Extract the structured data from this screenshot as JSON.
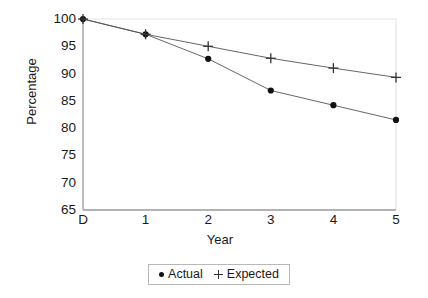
{
  "chart_data": {
    "type": "line",
    "title": "",
    "xlabel": "Year",
    "ylabel": "Percentage",
    "categories": [
      "D",
      "1",
      "2",
      "3",
      "4",
      "5"
    ],
    "x": [
      0,
      1,
      2,
      3,
      4,
      5
    ],
    "xtick_labels": [
      "D",
      "1",
      "2",
      "3",
      "4",
      "5"
    ],
    "ytick_labels": [
      "100",
      "95",
      "90",
      "85",
      "80",
      "75",
      "70",
      "65"
    ],
    "yticks": [
      100,
      95,
      90,
      85,
      80,
      75,
      70,
      65
    ],
    "ylim": [
      65,
      100
    ],
    "xlim": [
      0,
      5
    ],
    "grid": false,
    "legend_position": "bottom-center",
    "series": [
      {
        "name": "Actual",
        "marker": "filled-circle",
        "color": "#111111",
        "values": [
          100,
          97.2,
          92.7,
          86.9,
          84.2,
          81.5
        ]
      },
      {
        "name": "Expected",
        "marker": "plus",
        "color": "#333333",
        "values": [
          100,
          97.2,
          95.0,
          92.8,
          91.0,
          89.3
        ]
      }
    ],
    "legend": [
      {
        "label": "Actual",
        "marker": "filled-circle"
      },
      {
        "label": "Expected",
        "marker": "plus"
      }
    ]
  },
  "axes": {
    "ylabel": "Percentage",
    "xlabel": "Year"
  },
  "colors": {
    "background": "#ffffff",
    "axis": "#9a9a9a",
    "frame": "#e2e2e2",
    "line": "#555555",
    "actual_marker": "#111111",
    "expected_marker": "#333333",
    "text": "#1a1a1a",
    "legend_border": "#b8b8b8"
  }
}
